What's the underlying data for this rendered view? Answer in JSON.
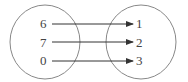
{
  "diagram": {
    "type": "mapping",
    "domain": {
      "elements": [
        "6",
        "7",
        "0"
      ]
    },
    "codomain": {
      "elements": [
        "1",
        "2",
        "3"
      ]
    },
    "arrows": [
      {
        "from": "6",
        "to": "1"
      },
      {
        "from": "7",
        "to": "2"
      },
      {
        "from": "0",
        "to": "3"
      }
    ],
    "colors": {
      "stroke": "#888888",
      "arrow": "#333333",
      "text": "#444444"
    }
  }
}
